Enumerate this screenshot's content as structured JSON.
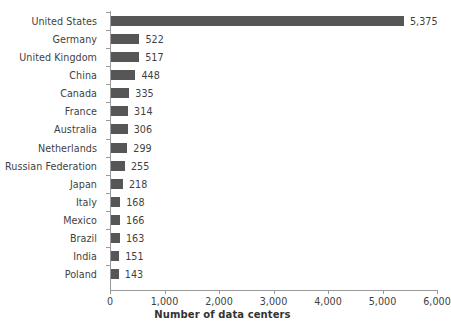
{
  "chart_data": {
    "type": "bar",
    "orientation": "horizontal",
    "title": "",
    "xlabel": "Number of data centers",
    "ylabel": "",
    "xlim": [
      0,
      6000
    ],
    "grid": false,
    "legend": false,
    "bar_color": "#565656",
    "axis_color": "#9a9a9a",
    "text_color": "#3f3f3f",
    "categories": [
      "United States",
      "Germany",
      "United Kingdom",
      "China",
      "Canada",
      "France",
      "Australia",
      "Netherlands",
      "Russian Federation",
      "Japan",
      "Italy",
      "Mexico",
      "Brazil",
      "India",
      "Poland"
    ],
    "values": [
      5375,
      522,
      517,
      448,
      335,
      314,
      306,
      299,
      255,
      218,
      168,
      166,
      163,
      151,
      143
    ],
    "value_labels": [
      "5,375",
      "522",
      "517",
      "448",
      "335",
      "314",
      "306",
      "299",
      "255",
      "218",
      "168",
      "166",
      "163",
      "151",
      "143"
    ],
    "xticks": [
      0,
      1000,
      2000,
      3000,
      4000,
      5000,
      6000
    ],
    "xtick_labels": [
      "0",
      "1,000",
      "2,000",
      "3,000",
      "4,000",
      "5,000",
      "6,000"
    ]
  }
}
